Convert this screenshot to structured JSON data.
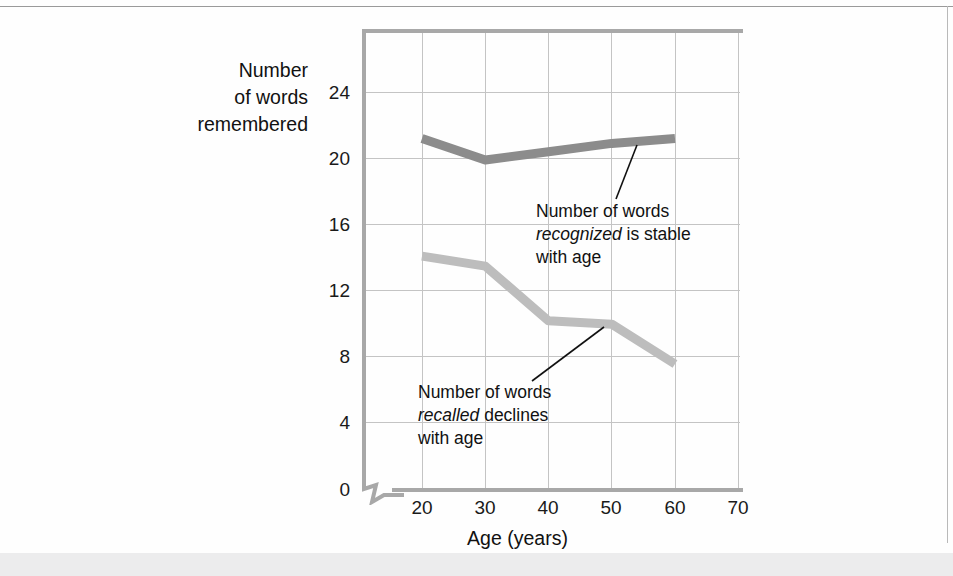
{
  "figure": {
    "y_axis_title": [
      "Number",
      "of words",
      "remembered"
    ],
    "x_axis_title": "Age (years)"
  },
  "annotations": {
    "recognized": {
      "line1": "Number of words",
      "emphasis": "recognized",
      "line2_rest": " is stable",
      "line3": "with age"
    },
    "recalled": {
      "line1": "Number of words",
      "emphasis": "recalled",
      "line2_rest": " declines",
      "line3": "with age"
    }
  },
  "chart_data": {
    "type": "line",
    "title": "",
    "xlabel": "Age (years)",
    "ylabel": "Number of words remembered",
    "xlim": [
      15,
      70
    ],
    "ylim": [
      0,
      27
    ],
    "xticks": [
      20,
      30,
      40,
      50,
      60,
      70
    ],
    "yticks": [
      0,
      4,
      8,
      12,
      16,
      20,
      24
    ],
    "grid": true,
    "legend": "none (inline annotations)",
    "axis_break": "y-axis broken between 0 and 4",
    "x": [
      20,
      30,
      40,
      50,
      60
    ],
    "series": [
      {
        "name": "Number of words recognized",
        "color": "#8c8c8c",
        "values": [
          21.2,
          19.9,
          20.4,
          20.9,
          21.2
        ]
      },
      {
        "name": "Number of words recalled",
        "color": "#bdbdbd",
        "values": [
          14.1,
          13.5,
          10.2,
          10.0,
          7.6
        ]
      }
    ]
  },
  "ytick_labels": [
    "24",
    "20",
    "16",
    "12",
    "8",
    "4",
    "0"
  ],
  "xtick_labels": [
    "20",
    "30",
    "40",
    "50",
    "60",
    "70"
  ]
}
